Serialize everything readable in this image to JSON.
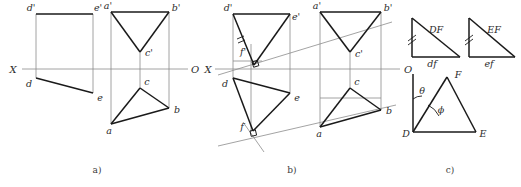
{
  "figure": {
    "panels": [
      {
        "id": "a",
        "caption": "a)"
      },
      {
        "id": "b",
        "caption": "b)"
      },
      {
        "id": "c",
        "caption": "c)"
      }
    ]
  },
  "colors": {
    "line": "#1a1a1a",
    "thin": "#8c8c8c",
    "label": "#2b2b2b",
    "background": "#ffffff"
  },
  "axis": {
    "left_label": "X",
    "right_label": "O"
  },
  "panel_a": {
    "caption": "a)",
    "axis_left": "X",
    "axis_right": "O",
    "labels": {
      "d_prime": "d'",
      "e_prime": "e'",
      "d": "d",
      "e": "e",
      "a_prime": "a'",
      "b_prime": "b'",
      "c_prime": "c'",
      "a": "a",
      "b": "b",
      "c": "c"
    }
  },
  "panel_b": {
    "caption": "b)",
    "axis_left": "X",
    "axis_right": "O",
    "labels": {
      "d_prime": "d'",
      "e_prime": "e'",
      "f_prime": "f'",
      "d": "d",
      "e": "e",
      "f": "f",
      "a_prime": "a'",
      "b_prime": "b'",
      "c_prime": "c'",
      "a": "a",
      "b": "b",
      "c": "c"
    }
  },
  "panel_c": {
    "caption": "c)",
    "labels": {
      "tri1_hyp": "DF",
      "tri1_base": "df",
      "tri2_hyp": "EF",
      "tri2_base": "ef",
      "vertex_D": "D",
      "vertex_E": "E",
      "vertex_F": "F",
      "angle_theta": "θ",
      "angle_phi": "ϕ"
    }
  }
}
